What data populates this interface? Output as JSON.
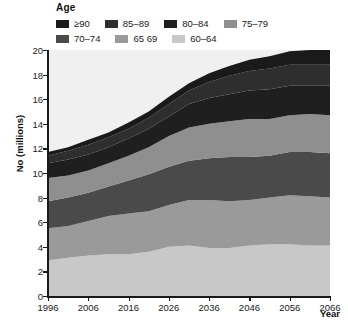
{
  "legend": {
    "title": "Age",
    "items": [
      {
        "label": "≥90",
        "color": "#1a1a1a"
      },
      {
        "label": "85–89",
        "color": "#2e2e2e"
      },
      {
        "label": "80–84",
        "color": "#1f1f1f"
      },
      {
        "label": "75–79",
        "color": "#8f8f8f"
      },
      {
        "label": "70–74",
        "color": "#4a4a4a"
      },
      {
        "label": "65 69",
        "color": "#9a9a9a"
      },
      {
        "label": "60–64",
        "color": "#c8c8c8"
      }
    ]
  },
  "chart_data": {
    "type": "area",
    "title": "",
    "xlabel": "Year",
    "ylabel": "No (millions)",
    "xlim": [
      1996,
      2066
    ],
    "ylim": [
      0,
      20
    ],
    "ytick_labels": [
      "0",
      "2",
      "4",
      "6",
      "8",
      "10",
      "12",
      "14",
      "16",
      "18",
      "20"
    ],
    "yticks": [
      0,
      2,
      4,
      6,
      8,
      10,
      12,
      14,
      16,
      18,
      20
    ],
    "xticks": [
      1996,
      2006,
      2016,
      2026,
      2036,
      2046,
      2056,
      2066
    ],
    "xtick_labels": [
      "1996",
      "2006",
      "2016",
      "2026",
      "2036",
      "2046",
      "2056",
      "2066"
    ],
    "grid": false,
    "legend_position": "top",
    "stacked": true,
    "stack_order_bottom_to_top": [
      "60–64",
      "65 69",
      "70–74",
      "75–79",
      "80–84",
      "85–89",
      "≥90"
    ],
    "x": [
      1996,
      2001,
      2006,
      2011,
      2016,
      2021,
      2026,
      2031,
      2036,
      2041,
      2046,
      2051,
      2056,
      2061,
      2066
    ],
    "series": [
      {
        "name": "60–64",
        "color": "#c8c8c8",
        "values": [
          2.9,
          3.1,
          3.3,
          3.4,
          3.4,
          3.6,
          4.0,
          4.1,
          3.9,
          3.9,
          4.1,
          4.2,
          4.2,
          4.1,
          4.1
        ]
      },
      {
        "name": "65 69",
        "color": "#9a9a9a",
        "values": [
          2.6,
          2.6,
          2.8,
          3.1,
          3.3,
          3.3,
          3.4,
          3.7,
          3.9,
          3.8,
          3.7,
          3.8,
          4.0,
          4.0,
          3.9
        ]
      },
      {
        "name": "70–74",
        "color": "#4a4a4a",
        "values": [
          2.2,
          2.3,
          2.3,
          2.4,
          2.7,
          3.0,
          3.1,
          3.2,
          3.4,
          3.6,
          3.5,
          3.4,
          3.5,
          3.6,
          3.6
        ]
      },
      {
        "name": "75–79",
        "color": "#8f8f8f",
        "values": [
          1.9,
          1.8,
          1.8,
          1.9,
          2.0,
          2.2,
          2.5,
          2.7,
          2.8,
          2.9,
          3.1,
          3.0,
          3.0,
          3.1,
          3.1
        ]
      },
      {
        "name": "80–84",
        "color": "#1f1f1f",
        "values": [
          1.2,
          1.3,
          1.3,
          1.3,
          1.4,
          1.5,
          1.6,
          1.9,
          2.1,
          2.2,
          2.3,
          2.4,
          2.4,
          2.3,
          2.4
        ]
      },
      {
        "name": "85–89",
        "color": "#2e2e2e",
        "values": [
          0.6,
          0.7,
          0.8,
          0.8,
          0.8,
          0.9,
          1.0,
          1.1,
          1.3,
          1.5,
          1.6,
          1.7,
          1.7,
          1.7,
          1.7
        ]
      },
      {
        "name": "≥90",
        "color": "#1a1a1a",
        "values": [
          0.3,
          0.3,
          0.4,
          0.4,
          0.5,
          0.5,
          0.6,
          0.6,
          0.7,
          0.8,
          0.9,
          1.0,
          1.1,
          1.2,
          1.2
        ]
      }
    ],
    "totals": [
      11.7,
      12.1,
      12.7,
      13.3,
      14.1,
      15.0,
      16.2,
      17.3,
      18.1,
      18.7,
      19.2,
      19.5,
      19.9,
      20.0,
      20.0
    ]
  }
}
